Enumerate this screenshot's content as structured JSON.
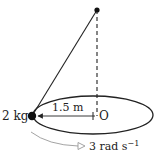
{
  "diagram": {
    "type": "conical-pendulum",
    "mass_label": "2 kg",
    "radius_label": "1.5 m",
    "center_label": "O",
    "angular_velocity_label": "3 rad s",
    "angular_velocity_exponent": "−1",
    "colors": {
      "line": "#222222",
      "arrow": "#888888",
      "background": "#ffffff"
    }
  }
}
